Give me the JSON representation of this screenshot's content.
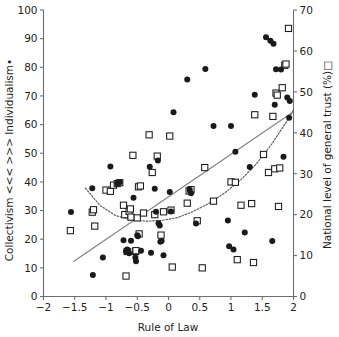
{
  "chart_data": {
    "type": "scatter",
    "title": "",
    "xlabel": "Rule of Law",
    "ylabel_left": "Collectivism <<< >>> Individualism•",
    "ylabel_right": "National level of general trust (%)□",
    "xlim": [
      -2,
      2
    ],
    "ylim_left": [
      0,
      100
    ],
    "ylim_right": [
      0,
      70
    ],
    "xticks": [
      -2,
      -1.5,
      -1,
      -0.5,
      0,
      0.5,
      1,
      1.5,
      2
    ],
    "xticklabels": [
      "−2",
      "−1.5",
      "−1",
      "−0.5",
      "0",
      "0.5",
      "1",
      "1.5",
      "2"
    ],
    "yticks_left": [
      0,
      10,
      20,
      30,
      40,
      50,
      60,
      70,
      80,
      90,
      100
    ],
    "yticklabels_left": [
      "0",
      "10",
      "20",
      "30",
      "40",
      "50",
      "60",
      "70",
      "80",
      "90",
      "100"
    ],
    "yticks_right": [
      0,
      10,
      20,
      30,
      40,
      50,
      60,
      70
    ],
    "yticklabels_right": [
      "0",
      "10",
      "20",
      "30",
      "40",
      "50",
      "60",
      "70"
    ],
    "grid": false,
    "legend_position": "none",
    "series": [
      {
        "name": "Individualism",
        "marker": "filled-circle",
        "color": "#1a1a1a",
        "axis": "left",
        "points": [
          [
            -1.21,
            7.5
          ],
          [
            -1.56,
            29.5
          ],
          [
            -1.22,
            37.8
          ],
          [
            -1.05,
            13.6
          ],
          [
            -0.93,
            45.4
          ],
          [
            -0.82,
            39.4
          ],
          [
            -0.78,
            39.9
          ],
          [
            -0.72,
            19.6
          ],
          [
            -0.68,
            15.8
          ],
          [
            -0.66,
            16.4
          ],
          [
            -0.63,
            15.1
          ],
          [
            -0.6,
            19.5
          ],
          [
            -0.56,
            34.5
          ],
          [
            -0.53,
            13.6
          ],
          [
            -0.52,
            12.3
          ],
          [
            -0.5,
            21.4
          ],
          [
            -0.49,
            21.0
          ],
          [
            -0.44,
            16.0
          ],
          [
            -0.3,
            45.3
          ],
          [
            -0.28,
            15.3
          ],
          [
            -0.22,
            37.6
          ],
          [
            -0.2,
            29.6
          ],
          [
            -0.17,
            47.5
          ],
          [
            -0.16,
            25.6
          ],
          [
            -0.14,
            24.8
          ],
          [
            -0.13,
            19.1
          ],
          [
            -0.11,
            19.4
          ],
          [
            -0.08,
            14.4
          ],
          [
            0.02,
            36.5
          ],
          [
            0.04,
            29.7
          ],
          [
            0.08,
            64.3
          ],
          [
            0.3,
            75.7
          ],
          [
            0.34,
            37.3
          ],
          [
            0.36,
            36.0
          ],
          [
            0.44,
            25.5
          ],
          [
            0.59,
            79.4
          ],
          [
            0.72,
            59.5
          ],
          [
            0.95,
            26.5
          ],
          [
            0.97,
            17.5
          ],
          [
            1.0,
            59.5
          ],
          [
            1.04,
            16.4
          ],
          [
            1.07,
            50.5
          ],
          [
            1.22,
            22.3
          ],
          [
            1.3,
            45.2
          ],
          [
            1.38,
            70.4
          ],
          [
            1.56,
            90.5
          ],
          [
            1.63,
            89.3
          ],
          [
            1.66,
            19.4
          ],
          [
            1.68,
            88.2
          ],
          [
            1.7,
            66.9
          ],
          [
            1.72,
            79.3
          ],
          [
            1.8,
            79.2
          ],
          [
            1.84,
            48.8
          ],
          [
            1.9,
            69.5
          ],
          [
            1.93,
            62.4
          ],
          [
            1.94,
            68.2
          ]
        ]
      },
      {
        "name": "National level of general trust",
        "marker": "open-square",
        "color": "#1a1a1a",
        "axis": "right",
        "points": [
          [
            -1.57,
            16.1
          ],
          [
            -1.22,
            20.6
          ],
          [
            -1.2,
            21.2
          ],
          [
            -1.18,
            17.2
          ],
          [
            -1.0,
            26.0
          ],
          [
            -0.93,
            25.7
          ],
          [
            -0.88,
            27.2
          ],
          [
            -0.82,
            27.6
          ],
          [
            -0.78,
            27.8
          ],
          [
            -0.72,
            22.3
          ],
          [
            -0.7,
            20.0
          ],
          [
            -0.68,
            5.0
          ],
          [
            -0.66,
            11.0
          ],
          [
            -0.63,
            20.8
          ],
          [
            -0.61,
            21.4
          ],
          [
            -0.6,
            19.4
          ],
          [
            -0.57,
            34.5
          ],
          [
            -0.53,
            11.0
          ],
          [
            -0.52,
            11.2
          ],
          [
            -0.5,
            19.2
          ],
          [
            -0.48,
            26.8
          ],
          [
            -0.47,
            15.3
          ],
          [
            -0.45,
            27.0
          ],
          [
            -0.4,
            20.4
          ],
          [
            -0.31,
            39.5
          ],
          [
            -0.26,
            30.3
          ],
          [
            -0.22,
            20.0
          ],
          [
            -0.18,
            34.3
          ],
          [
            -0.12,
            15.0
          ],
          [
            -0.08,
            20.7
          ],
          [
            0.02,
            39.2
          ],
          [
            0.04,
            21.1
          ],
          [
            0.06,
            7.2
          ],
          [
            0.3,
            22.8
          ],
          [
            0.33,
            25.8
          ],
          [
            0.36,
            26.1
          ],
          [
            0.46,
            18.5
          ],
          [
            0.54,
            7.0
          ],
          [
            0.58,
            31.5
          ],
          [
            0.72,
            23.3
          ],
          [
            1.0,
            28.0
          ],
          [
            1.07,
            27.9
          ],
          [
            1.1,
            9.0
          ],
          [
            1.16,
            22.3
          ],
          [
            1.33,
            22.7
          ],
          [
            1.36,
            8.3
          ],
          [
            1.38,
            44.4
          ],
          [
            1.52,
            34.7
          ],
          [
            1.6,
            30.3
          ],
          [
            1.67,
            44.0
          ],
          [
            1.7,
            31.2
          ],
          [
            1.72,
            49.7
          ],
          [
            1.74,
            49.2
          ],
          [
            1.76,
            22.0
          ],
          [
            1.78,
            31.4
          ],
          [
            1.82,
            51.0
          ],
          [
            1.86,
            56.5
          ],
          [
            1.88,
            56.8
          ],
          [
            1.92,
            65.5
          ]
        ]
      }
    ],
    "trendlines": [
      {
        "name": "individualism-linear-fit",
        "style": "solid",
        "axis": "left",
        "points": [
          [
            -1.52,
            12.2
          ],
          [
            2.0,
            64.5
          ]
        ]
      },
      {
        "name": "trust-quadratic-fit",
        "style": "dotted",
        "axis": "right",
        "points": [
          [
            -1.33,
            26.5
          ],
          [
            -1.1,
            22.3
          ],
          [
            -0.85,
            19.8
          ],
          [
            -0.6,
            18.7
          ],
          [
            -0.35,
            18.4
          ],
          [
            -0.1,
            18.6
          ],
          [
            0.15,
            19.3
          ],
          [
            0.4,
            20.8
          ],
          [
            0.65,
            22.8
          ],
          [
            0.9,
            25.3
          ],
          [
            1.15,
            28.4
          ],
          [
            1.4,
            32.3
          ],
          [
            1.65,
            37.2
          ],
          [
            1.9,
            43.0
          ],
          [
            2.0,
            45.6
          ]
        ]
      }
    ]
  },
  "axes": {
    "x_title": "Rule of Law",
    "y_left_title": "Collectivism <<< >>> Individualism•",
    "y_right_title": "National level of general trust (%)□"
  }
}
